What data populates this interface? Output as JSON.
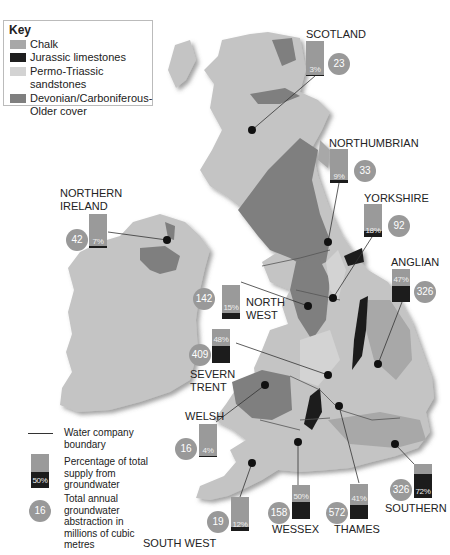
{
  "key": {
    "title": "Key",
    "items": [
      {
        "label": "Chalk",
        "color": "#a8a8a8"
      },
      {
        "label": "Jurassic limestones",
        "color": "#1e1e1e"
      },
      {
        "label": "Permo-Triassic sandstones",
        "color": "#d3d3d3"
      },
      {
        "label": "Devonian/Carboniferous-",
        "color": "#7f7f7f"
      }
    ],
    "item4_line2": "Older cover"
  },
  "colors": {
    "land": "#c4c4c4",
    "chalk": "#a8a8a8",
    "jurassic": "#1e1e1e",
    "permo": "#d3d3d3",
    "devonian": "#7f7f7f",
    "bar": "#9a9a9a",
    "circle": "#999999"
  },
  "regions": [
    {
      "name": "SCOTLAND",
      "name2": "",
      "percent": "3%",
      "pct": 3,
      "abstraction": "23"
    },
    {
      "name": "NORTHUMBRIAN",
      "name2": "",
      "percent": "9%",
      "pct": 9,
      "abstraction": "33"
    },
    {
      "name": "YORKSHIRE",
      "name2": "",
      "percent": "18%",
      "pct": 18,
      "abstraction": "92"
    },
    {
      "name": "ANGLIAN",
      "name2": "",
      "percent": "47%",
      "pct": 47,
      "abstraction": "326"
    },
    {
      "name": "NORTHERN",
      "name2": "IRELAND",
      "percent": "7%",
      "pct": 7,
      "abstraction": "42"
    },
    {
      "name": "NORTH",
      "name2": "WEST",
      "percent": "15%",
      "pct": 15,
      "abstraction": "142"
    },
    {
      "name": "SEVERN",
      "name2": "TRENT",
      "percent": "48%",
      "pct": 48,
      "abstraction": "409"
    },
    {
      "name": "WELSH",
      "name2": "",
      "percent": "4%",
      "pct": 4,
      "abstraction": "16"
    },
    {
      "name": "SOUTH WEST",
      "name2": "",
      "percent": "12%",
      "pct": 12,
      "abstraction": "19"
    },
    {
      "name": "WESSEX",
      "name2": "",
      "percent": "50%",
      "pct": 50,
      "abstraction": "158"
    },
    {
      "name": "THAMES",
      "name2": "",
      "percent": "41%",
      "pct": 41,
      "abstraction": "572"
    },
    {
      "name": "SOUTHERN",
      "name2": "",
      "percent": "72%",
      "pct": 72,
      "abstraction": "326"
    }
  ],
  "legend": {
    "boundary": "Water company boundary",
    "bar_sample": "50%",
    "bar_text": "Percentage of total supply from groundwater",
    "circle_sample": "16",
    "circle_text": "Total annual groundwater abstraction in millions of cubic metres"
  }
}
